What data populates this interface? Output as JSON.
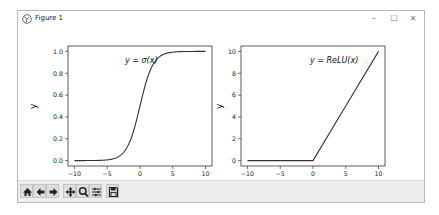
{
  "window": {
    "title": "Figure 1",
    "controls": {
      "minimize": "–",
      "maximize": "☐",
      "close": "✕"
    }
  },
  "toolbar": {
    "buttons": [
      {
        "name": "home",
        "icon": "home-icon"
      },
      {
        "name": "back",
        "icon": "arrow-left-icon"
      },
      {
        "name": "forward",
        "icon": "arrow-right-icon"
      },
      {
        "name": "pan",
        "icon": "move-icon"
      },
      {
        "name": "zoom",
        "icon": "zoom-icon"
      },
      {
        "name": "configure-subplots",
        "icon": "sliders-icon"
      },
      {
        "name": "save",
        "icon": "save-icon"
      }
    ]
  },
  "plots": {
    "left": {
      "annotation": "y = σ(x)",
      "ylabel": "y",
      "xticks": [
        "−10",
        "−5",
        "0",
        "5",
        "10"
      ],
      "yticks": [
        "0.0",
        "0.2",
        "0.4",
        "0.6",
        "0.8",
        "1.0"
      ]
    },
    "right": {
      "annotation": "y = ReLU(x)",
      "ylabel": "y",
      "xticks": [
        "−10",
        "−5",
        "0",
        "5",
        "10"
      ],
      "yticks": [
        "0",
        "2",
        "4",
        "6",
        "8",
        "10"
      ]
    }
  },
  "chart_data": [
    {
      "type": "line",
      "title": "",
      "annotation": "y = σ(x)",
      "xlabel": "",
      "ylabel": "y",
      "xlim": [
        -10,
        10
      ],
      "ylim": [
        0,
        1
      ],
      "xticks": [
        -10,
        -5,
        0,
        5,
        10
      ],
      "yticks": [
        0.0,
        0.2,
        0.4,
        0.6,
        0.8,
        1.0
      ],
      "grid": false,
      "series": [
        {
          "name": "sigmoid",
          "x": [
            -10,
            -8,
            -6,
            -4,
            -3,
            -2,
            -1,
            0,
            1,
            2,
            3,
            4,
            6,
            8,
            10
          ],
          "y": [
            0.0,
            0.0003,
            0.0025,
            0.018,
            0.047,
            0.119,
            0.269,
            0.5,
            0.731,
            0.881,
            0.953,
            0.982,
            0.9975,
            0.9997,
            1.0
          ]
        }
      ]
    },
    {
      "type": "line",
      "title": "",
      "annotation": "y = ReLU(x)",
      "xlabel": "",
      "ylabel": "y",
      "xlim": [
        -10,
        10
      ],
      "ylim": [
        0,
        10
      ],
      "xticks": [
        -10,
        -5,
        0,
        5,
        10
      ],
      "yticks": [
        0,
        2,
        4,
        6,
        8,
        10
      ],
      "grid": false,
      "series": [
        {
          "name": "relu",
          "x": [
            -10,
            -5,
            0,
            5,
            10
          ],
          "y": [
            0,
            0,
            0,
            5,
            10
          ]
        }
      ]
    }
  ]
}
